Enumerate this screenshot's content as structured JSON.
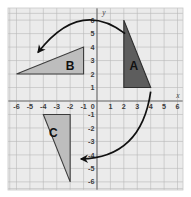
{
  "figure": {
    "title": "",
    "background_color": "#ffffff",
    "plot_background_color": "#ebebeb",
    "grid_color": "#b9b9b9",
    "axis_color": "#6e6e6e"
  },
  "axes": {
    "x_label": "x",
    "y_label": "y",
    "x_ticks": [
      "-6",
      "-5",
      "-4",
      "-3",
      "-2",
      "-1",
      "0",
      "1",
      "2",
      "3",
      "4",
      "5",
      "6"
    ],
    "y_ticks": [
      "6",
      "5",
      "4",
      "3",
      "2",
      "1",
      "0",
      "-1",
      "-2",
      "-3",
      "-4",
      "-5",
      "-6"
    ],
    "origin_label": "0"
  },
  "chart_data": {
    "type": "scatter",
    "title": "",
    "xlabel": "x",
    "ylabel": "y",
    "xlim": [
      -6.7,
      6.6
    ],
    "ylim": [
      -6.7,
      6.6
    ],
    "grid": true,
    "legend": "none",
    "x_ticks": [
      -6,
      -5,
      -4,
      -3,
      -2,
      -1,
      0,
      1,
      2,
      3,
      4,
      5,
      6
    ],
    "y_ticks": [
      -6,
      -5,
      -4,
      -3,
      -2,
      -1,
      0,
      1,
      2,
      3,
      4,
      5,
      6
    ],
    "shapes": [
      {
        "name": "A",
        "label": "A",
        "kind": "triangle",
        "fill": "#5d5d5d",
        "stroke": "#2e2e2e",
        "label_color": "#111111",
        "vertices": [
          [
            2,
            6
          ],
          [
            2,
            1
          ],
          [
            4,
            1
          ]
        ],
        "label_position": [
          2.75,
          2.6
        ]
      },
      {
        "name": "B",
        "label": "B",
        "kind": "triangle",
        "fill": "#bdbdbd",
        "stroke": "#3c3c3c",
        "label_color": "#111111",
        "vertices": [
          [
            -6,
            2
          ],
          [
            -1,
            2
          ],
          [
            -1,
            4
          ]
        ],
        "label_position": [
          -2.0,
          2.6
        ]
      },
      {
        "name": "C",
        "label": "C",
        "kind": "triangle",
        "fill": "#bdbdbd",
        "stroke": "#3c3c3c",
        "label_color": "#111111",
        "vertices": [
          [
            -4,
            -1
          ],
          [
            -2,
            -1
          ],
          [
            -2,
            -6
          ]
        ],
        "label_position": [
          -3.25,
          -2.3
        ]
      }
    ],
    "arrows": [
      {
        "name": "arrow-a-to-b",
        "description": "curved arrow from triangle A over the top to triangle B",
        "start": [
          2.1,
          5.0
        ],
        "control": [
          -1.3,
          7.6
        ],
        "end": [
          -4.4,
          3.6
        ],
        "color": "#111111"
      },
      {
        "name": "arrow-a-to-c",
        "description": "curved arrow from triangle A around the bottom to triangle C",
        "start": [
          4.0,
          0.7
        ],
        "control": [
          3.3,
          -4.2
        ],
        "end": [
          -1.2,
          -4.3
        ],
        "color": "#111111"
      }
    ]
  }
}
